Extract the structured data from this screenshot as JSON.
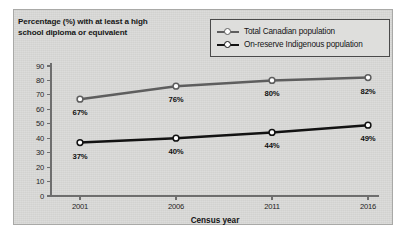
{
  "chart_data": {
    "type": "line",
    "title": "",
    "xlabel": "Census year",
    "ylabel": "Percentage (%) with at least a high school diploma or equivalent",
    "categories": [
      "2001",
      "2006",
      "2011",
      "2016"
    ],
    "x": [
      2001,
      2006,
      2011,
      2016
    ],
    "ylim": [
      0,
      90
    ],
    "yticks": [
      "0",
      "10",
      "20",
      "30",
      "40",
      "50",
      "60",
      "70",
      "80",
      "90"
    ],
    "grid": false,
    "legend_position": "top-right",
    "series": [
      {
        "name": "Total Canadian population",
        "values": [
          67,
          76,
          80,
          82
        ],
        "labels": [
          "67%",
          "76%",
          "80%",
          "82%"
        ],
        "color": "#5e5e5e",
        "marker": "open-circle"
      },
      {
        "name": "On-reserve Indigenous population",
        "values": [
          37,
          40,
          44,
          49
        ],
        "labels": [
          "37%",
          "40%",
          "44%",
          "49%"
        ],
        "color": "#121212",
        "marker": "open-circle"
      }
    ]
  },
  "panel": {
    "background_color": "#d9d9d7",
    "border_color": "#a9a9a7"
  },
  "axis": {
    "line_color": "#6e6e6e"
  }
}
